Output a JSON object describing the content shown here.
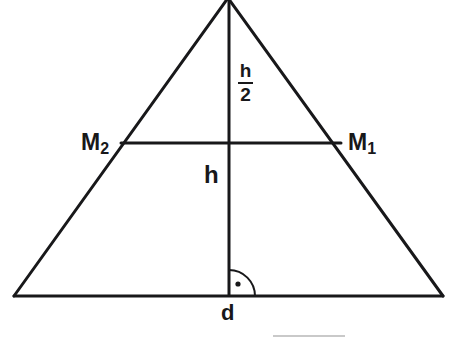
{
  "figure": {
    "background_color": "#ffffff",
    "stroke_color": "#18181a",
    "artifact_color": "#c9c9c9",
    "width": 452,
    "height": 341
  },
  "labels": {
    "midpoint_right": {
      "base": "M",
      "subscript": "1"
    },
    "midpoint_left": {
      "base": "M",
      "subscript": "2"
    },
    "height": "h",
    "half_height_numerator": "h",
    "half_height_denominator": "2",
    "base_length": "d"
  },
  "geometry": {
    "apex": {
      "x": 228,
      "y": 0
    },
    "bottom_left": {
      "x": 14,
      "y": 296
    },
    "bottom_right": {
      "x": 443,
      "y": 296
    },
    "altitude_x": 229,
    "altitude_foot": {
      "x": 229,
      "y": 296
    },
    "midsegment": {
      "y": 143,
      "x_left": 121,
      "x_right": 341
    },
    "right_angle_marker": {
      "radius": 26,
      "dot": {
        "x": 238,
        "y": 284
      },
      "dot_radius": 2.6
    },
    "stroke_width_sides": 3,
    "stroke_width_base": 3,
    "stroke_width_altitude": 3,
    "stroke_width_midsegment": 3,
    "stroke_width_marker": 2,
    "artifact_line": {
      "x1": 273,
      "x2": 345,
      "y": 336,
      "width": 2
    }
  }
}
